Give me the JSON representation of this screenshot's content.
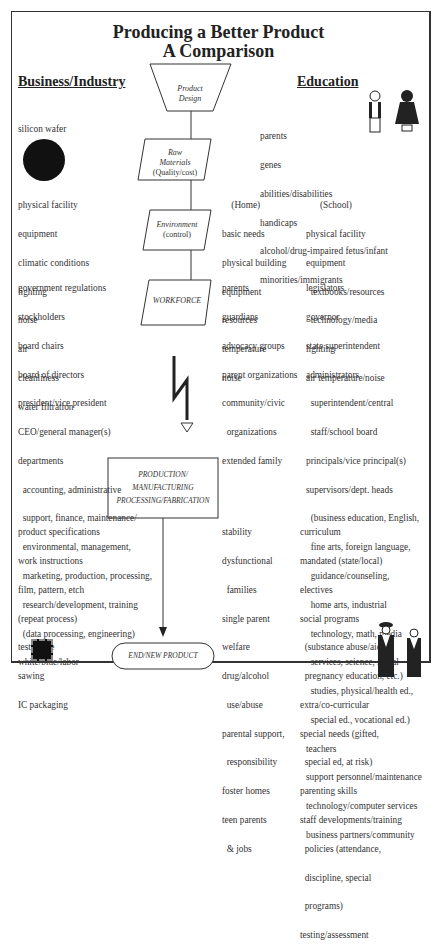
{
  "title": {
    "line1": "Producing a Better Product",
    "line2": "A Comparison"
  },
  "columns": {
    "business": "Business/Industry",
    "education": "Education"
  },
  "flow": {
    "product_design": [
      "Product",
      "Design"
    ],
    "raw_materials": [
      "Raw",
      "Materials",
      "(Quality/cost)"
    ],
    "environment": [
      "Environment",
      "(control)"
    ],
    "workforce": "WORKFORCE",
    "production": [
      "PRODUCTION/",
      "MANUFACTURING",
      "PROCESSING/FABRICATION"
    ],
    "end": "END/NEW PRODUCT"
  },
  "business": {
    "raw": [
      "silicon wafer"
    ],
    "environment": [
      "physical facility",
      "equipment",
      "climatic conditions",
      "lighting",
      "noise",
      "air",
      "cleanliness",
      "water filtration"
    ],
    "workforce": [
      "government regulations",
      "stockholders",
      "board chairs",
      "board of directors",
      "president/vice president",
      "CEO/general manager(s)",
      "departments",
      "  accounting, administrative",
      "  support, finance, maintenance/",
      "  environmental, management,",
      "  marketing, production, processing,",
      "  research/development, training",
      "  (data processing, engineering)",
      "white/blue/labor"
    ],
    "production": [
      "product specifications",
      "work instructions",
      "film, pattern, etch",
      "(repeat process)",
      "test phase",
      "sawing",
      "IC packaging"
    ]
  },
  "education": {
    "raw": [
      "parents",
      "genes",
      "abilities/disabilities",
      "handicaps",
      "alcohol/drug-impaired fetus/infant",
      "minorities/immigrants"
    ],
    "environment_home": [
      "    (Home)",
      "basic needs",
      "physical building",
      "equipment",
      "resources",
      "temperature",
      "noise"
    ],
    "environment_school": [
      "      (School)",
      "physical facility",
      "equipment",
      "  textbooks/resources",
      "  technology/media",
      "lighting",
      "air temperature/noise"
    ],
    "workforce_home": [
      "parents",
      "guardians",
      "advocacy groups",
      "parent organizations",
      "community/civic",
      "  organizations",
      "extended family"
    ],
    "workforce_school": [
      "legislators",
      "governor",
      "state superintendent",
      "administrators",
      "  superintendent/central",
      "  staff/school board",
      "principals/vice principal(s)",
      "supervisors/dept. heads",
      "  (business education, English,",
      "  fine arts, foreign language,",
      "  guidance/counseling,",
      "  home arts, industrial",
      "  technology, math, media",
      "  services, science, social",
      "  studies, physical/health ed.,",
      "  special ed., vocational ed.)",
      "teachers",
      "support personnel/maintenance",
      "technology/computer services",
      "business partners/community"
    ],
    "production_home": [
      "stability",
      "dysfunctional",
      "  families",
      "single parent",
      "welfare",
      "drug/alcohol",
      "  use/abuse",
      "parental support,",
      "  responsibility",
      "foster homes",
      "teen parents",
      "  & jobs"
    ],
    "production_school": [
      "curriculum",
      "mandated (state/local)",
      "electives",
      "social programs",
      "  (substance abuse/aids/",
      "  pregnancy education, etc.)",
      "extra/co-curricular",
      "special needs (gifted,",
      "  special ed, at risk)",
      "parenting skills",
      "staff developments/training",
      "  policies (attendance,",
      "  discipline, special",
      "  programs)",
      "testing/assessment"
    ]
  },
  "icons": [
    "silicon-wafer-icon",
    "children-icon",
    "lightning-bolt-icon",
    "chip-icon",
    "graduates-icon"
  ]
}
